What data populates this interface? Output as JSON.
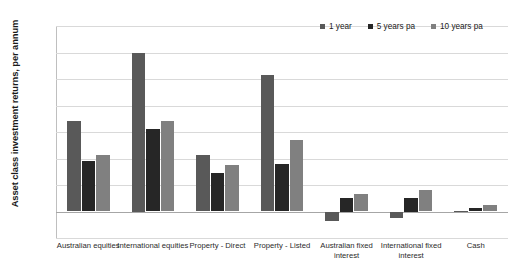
{
  "chart_data": {
    "type": "bar",
    "title": "",
    "xlabel": "",
    "ylabel": "Asset class investment returns, per annum",
    "ylim": [
      -5.0,
      35.0
    ],
    "ytick_step": 5.0,
    "grid": true,
    "legend_position": "top-right",
    "value_suffix": "%",
    "categories": [
      "Australian equities",
      "International equities",
      "Property - Direct",
      "Property - Listed",
      "Australian fixed interest",
      "International fixed interest",
      "Cash"
    ],
    "ytick_labels": [
      "35.0%",
      "30.0%",
      "25.0%",
      "20.0%",
      "15.0%",
      "10.0%",
      "5.0%",
      "0.0%",
      "-5.0%"
    ],
    "ytick_values": [
      35.0,
      30.0,
      25.0,
      20.0,
      15.0,
      10.0,
      5.0,
      0.0,
      -5.0
    ],
    "series": [
      {
        "name": "1 year",
        "color": "#595959",
        "values": [
          17.0,
          30.0,
          10.7,
          25.7,
          -1.8,
          -1.3,
          0.1
        ]
      },
      {
        "name": "5 years pa",
        "color": "#262626",
        "values": [
          9.6,
          15.5,
          7.3,
          9.0,
          2.5,
          2.5,
          0.6
        ]
      },
      {
        "name": "10 years pa",
        "color": "#808080",
        "values": [
          10.6,
          17.0,
          8.8,
          13.5,
          3.3,
          4.0,
          1.3
        ]
      }
    ]
  },
  "legend": {
    "items": [
      {
        "label": "1 year",
        "color": "#595959"
      },
      {
        "label": "5 years pa",
        "color": "#262626"
      },
      {
        "label": "10 years pa",
        "color": "#808080"
      }
    ]
  }
}
